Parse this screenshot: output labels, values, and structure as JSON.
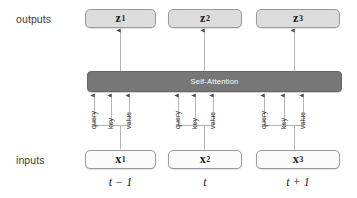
{
  "figure": {
    "type": "self-attention-architecture-diagram",
    "row_labels": {
      "outputs": "outputs",
      "inputs": "inputs"
    },
    "module": {
      "label": "Self-Attention",
      "fill_color": "#777777",
      "text_color": "#ffffff"
    },
    "outputs": [
      {
        "symbol": "z",
        "subscript": "1",
        "left": 85,
        "width": 71
      },
      {
        "symbol": "z",
        "subscript": "2",
        "left": 168,
        "width": 74
      },
      {
        "symbol": "z",
        "subscript": "3",
        "left": 256,
        "width": 84
      }
    ],
    "inputs": [
      {
        "symbol": "x",
        "subscript": "1",
        "left": 85,
        "width": 71
      },
      {
        "symbol": "x",
        "subscript": "2",
        "left": 168,
        "width": 74
      },
      {
        "symbol": "x",
        "subscript": "3",
        "left": 256,
        "width": 84
      }
    ],
    "projection_labels": [
      "query",
      "key",
      "value"
    ],
    "projection_groups": [
      {
        "index": 0,
        "query_x": 94,
        "key_x": 111,
        "value_x": 129,
        "stem_x": 120,
        "bracket_left": 94,
        "bracket_right": 129
      },
      {
        "index": 1,
        "query_x": 178,
        "key_x": 195,
        "value_x": 213,
        "stem_x": 204,
        "bracket_left": 178,
        "bracket_right": 213
      },
      {
        "index": 2,
        "query_x": 264,
        "key_x": 284,
        "value_x": 303,
        "stem_x": 294,
        "bracket_left": 264,
        "bracket_right": 303
      }
    ],
    "timesteps": [
      "t − 1",
      "t",
      "t + 1"
    ],
    "timestep_positions": [
      {
        "left": 85,
        "width": 71
      },
      {
        "left": 168,
        "width": 74
      },
      {
        "left": 256,
        "width": 84
      }
    ],
    "colors": {
      "output_box_fill": "#dcdcdc",
      "input_box_fill": "#fbfbfb",
      "box_border": "#9a9a9a",
      "wire": "#b4b4b4",
      "text": "#1a1a1a",
      "background": "#ffffff"
    }
  }
}
